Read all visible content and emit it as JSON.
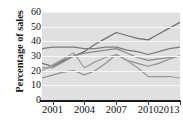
{
  "chart_data": {
    "type": "line",
    "title": "",
    "xlabel": "",
    "ylabel": "Percentage of sales",
    "ylim": [
      0,
      60
    ],
    "yticks": [
      0,
      10,
      20,
      30,
      40,
      50,
      60
    ],
    "xlim": [
      2000,
      2013
    ],
    "xticks": [
      2001,
      2004,
      2007,
      2010,
      2013
    ],
    "xtick_labels": [
      "2001",
      "2004",
      "2007",
      "2010",
      "2013"
    ],
    "grid": "horizontal",
    "legend": "none",
    "x": [
      2000,
      2001,
      2002,
      2003,
      2004,
      2005,
      2006,
      2007,
      2008,
      2009,
      2010,
      2011,
      2012,
      2013
    ],
    "series": [
      {
        "name": "series-1",
        "color": "#6e6e6e",
        "values": [
          25,
          23,
          27,
          30,
          33,
          38,
          42,
          46,
          44,
          42,
          41,
          45,
          49,
          53
        ]
      },
      {
        "name": "series-2",
        "color": "#7a7a7a",
        "values": [
          35,
          36,
          36,
          36,
          35,
          35,
          36,
          36,
          34,
          33,
          31,
          33,
          35,
          36
        ]
      },
      {
        "name": "series-3",
        "color": "#888888",
        "values": [
          22,
          22,
          26,
          30,
          32,
          33,
          34,
          35,
          32,
          29,
          27,
          28,
          29,
          30
        ]
      },
      {
        "name": "series-4",
        "color": "#8f8f8f",
        "values": [
          15,
          17,
          19,
          20,
          17,
          20,
          25,
          31,
          27,
          25,
          23,
          25,
          28,
          30
        ]
      },
      {
        "name": "series-5",
        "color": "#9a9a9a",
        "values": [
          20,
          24,
          28,
          32,
          22,
          26,
          29,
          31,
          27,
          22,
          16,
          16,
          16,
          15
        ]
      }
    ]
  },
  "axis": {
    "ylabel_text": "Percentage of sales",
    "ytick_labels": [
      "60",
      "50",
      "40",
      "30",
      "20",
      "10",
      "0"
    ]
  }
}
